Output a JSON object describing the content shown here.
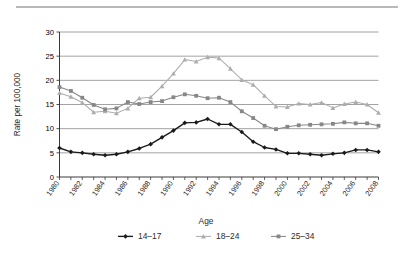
{
  "figure": {
    "background": "#ffffff",
    "top_rule_color": "#b9b9b9"
  },
  "chart_data": {
    "type": "line",
    "title": "",
    "xlabel": "",
    "ylabel": "Rate per 100,000",
    "legend_title": "Age",
    "legend_position": "bottom",
    "grid": true,
    "grid_axis": "y",
    "xlim": [
      1980,
      2008
    ],
    "ylim": [
      0,
      30
    ],
    "yticks": [
      0,
      5,
      10,
      15,
      20,
      25,
      30
    ],
    "ytick_labels": [
      "0",
      "5",
      "10",
      "15",
      "20",
      "25",
      "30"
    ],
    "x": [
      1980,
      1981,
      1982,
      1983,
      1984,
      1985,
      1986,
      1987,
      1988,
      1989,
      1990,
      1991,
      1992,
      1993,
      1994,
      1995,
      1996,
      1997,
      1998,
      1999,
      2000,
      2001,
      2002,
      2003,
      2004,
      2005,
      2006,
      2007,
      2008
    ],
    "xtick_labels": [
      "1980",
      "1982",
      "1984",
      "1986",
      "1988",
      "1990",
      "1992",
      "1994",
      "1996",
      "1998",
      "2000",
      "2002",
      "2004",
      "2006",
      "2008"
    ],
    "xtick_values": [
      1980,
      1982,
      1984,
      1986,
      1988,
      1990,
      1992,
      1994,
      1996,
      1998,
      2000,
      2002,
      2004,
      2006,
      2008
    ],
    "series": [
      {
        "name": "14-17",
        "label": "14–17",
        "color": "#1a1a1a",
        "marker": "diamond",
        "values": [
          6.0,
          5.2,
          5.0,
          4.7,
          4.5,
          4.7,
          5.2,
          5.9,
          6.8,
          8.2,
          9.6,
          11.2,
          11.3,
          12.0,
          10.9,
          10.9,
          9.3,
          7.3,
          6.1,
          5.7,
          4.9,
          4.9,
          4.7,
          4.5,
          4.8,
          5.0,
          5.6,
          5.6,
          5.2
        ]
      },
      {
        "name": "18-24",
        "label": "18–24",
        "color": "#adadad",
        "marker": "triangle",
        "values": [
          17.4,
          16.6,
          15.4,
          13.4,
          13.6,
          13.2,
          14.2,
          16.3,
          16.5,
          18.8,
          21.4,
          24.3,
          23.9,
          24.8,
          24.6,
          22.4,
          20.1,
          19.1,
          16.8,
          14.6,
          14.5,
          15.2,
          15.0,
          15.4,
          14.3,
          15.1,
          15.5,
          15.0,
          13.3
        ]
      },
      {
        "name": "25-34",
        "label": "25–34",
        "color": "#878787",
        "marker": "square",
        "values": [
          18.6,
          17.8,
          16.4,
          14.9,
          14.0,
          14.2,
          15.5,
          15.1,
          15.5,
          15.7,
          16.5,
          17.1,
          16.8,
          16.3,
          16.4,
          15.5,
          13.6,
          12.2,
          10.6,
          9.9,
          10.4,
          10.7,
          10.8,
          10.9,
          11.0,
          11.3,
          11.1,
          11.1,
          10.6
        ]
      }
    ]
  }
}
